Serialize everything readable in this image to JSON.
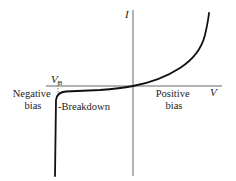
{
  "diagram": {
    "axes": {
      "y_label": "I",
      "x_label": "V"
    },
    "labels": {
      "breakdown_voltage_main": "V",
      "breakdown_voltage_sub": "B",
      "negative_bias_line1": "Negative",
      "negative_bias_line2": "bias",
      "breakdown": "-Breakdown",
      "positive_bias_line1": "Positive",
      "positive_bias_line2": "bias"
    },
    "colors": {
      "curve": "#111111",
      "axes": "#444444",
      "text": "#222222",
      "background": "#ffffff"
    }
  }
}
